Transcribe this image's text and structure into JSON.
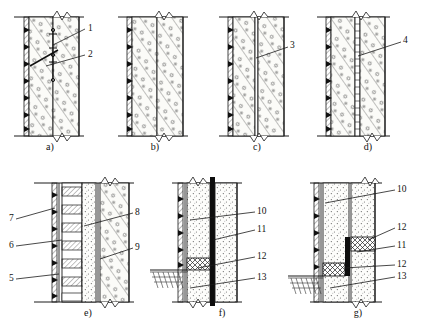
{
  "figure": {
    "type": "technical-section-diagram",
    "width": 429,
    "height": 332,
    "background_color": "#ffffff",
    "line_color": "#1a1a1a",
    "panel_count": 7
  },
  "panels": [
    {
      "id": "a",
      "letter": "a)",
      "callouts": [
        "1",
        "2"
      ],
      "layers": [
        "hatched-render",
        "masonry-circles-hatch",
        "masonry-circles-hatch"
      ],
      "has_break_symbol": true
    },
    {
      "id": "b",
      "letter": "b)",
      "callouts": [],
      "layers": [
        "hatched-render",
        "masonry-circles-hatch",
        "masonry-circles-hatch"
      ],
      "has_break_symbol": true
    },
    {
      "id": "c",
      "letter": "c)",
      "callouts": [
        "3"
      ],
      "layers": [
        "hatched-render",
        "masonry-circles-hatch",
        "cavity",
        "masonry-circles-hatch"
      ],
      "has_break_symbol": true
    },
    {
      "id": "d",
      "letter": "d)",
      "callouts": [
        "4"
      ],
      "layers": [
        "hatched-render",
        "masonry-circles-hatch",
        "ladder-tie-layer",
        "masonry-circles-hatch"
      ],
      "has_break_symbol": true
    },
    {
      "id": "e",
      "letter": "e)",
      "callouts": [
        "5",
        "6",
        "7",
        "8",
        "9"
      ],
      "layers": [
        "hatched-render",
        "block-course-stack",
        "stipple-insulation",
        "masonry-circles-hatch"
      ],
      "has_break_symbol": true
    },
    {
      "id": "f",
      "letter": "f)",
      "callouts": [
        "10",
        "11",
        "12",
        "13"
      ],
      "layers": [
        "hatched-render",
        "stipple-insulation",
        "black-membrane-bar",
        "stipple-insulation"
      ],
      "has_break_symbol": true,
      "has_floor_slab": true
    },
    {
      "id": "g",
      "letter": "g)",
      "callouts": [
        "10",
        "12",
        "11",
        "12",
        "13"
      ],
      "layers": [
        "hatched-render",
        "stipple-insulation",
        "crosshatch-blocks",
        "stipple-insulation"
      ],
      "has_break_symbol": true,
      "has_floor_slab": true
    }
  ],
  "callout_labels": {
    "a": [
      {
        "key": "1",
        "text": "1",
        "x": 88,
        "y": 31
      },
      {
        "key": "2",
        "text": "2",
        "x": 88,
        "y": 57
      }
    ],
    "c": [
      {
        "key": "3",
        "text": "3",
        "x": 290,
        "y": 48
      }
    ],
    "d": [
      {
        "key": "4",
        "text": "4",
        "x": 403,
        "y": 43
      }
    ],
    "e": [
      {
        "key": "7",
        "text": "7",
        "x": 9,
        "y": 221
      },
      {
        "key": "6",
        "text": "6",
        "x": 9,
        "y": 248
      },
      {
        "key": "5",
        "text": "5",
        "x": 9,
        "y": 281
      },
      {
        "key": "8",
        "text": "8",
        "x": 135,
        "y": 215
      },
      {
        "key": "9",
        "text": "9",
        "x": 135,
        "y": 250
      }
    ],
    "f": [
      {
        "key": "10",
        "text": "10",
        "x": 257,
        "y": 214
      },
      {
        "key": "11",
        "text": "11",
        "x": 257,
        "y": 232
      },
      {
        "key": "12",
        "text": "12",
        "x": 257,
        "y": 259
      },
      {
        "key": "13",
        "text": "13",
        "x": 257,
        "y": 280
      }
    ],
    "g": [
      {
        "key": "10",
        "text": "10",
        "x": 397,
        "y": 192
      },
      {
        "key": "12a",
        "text": "12",
        "x": 397,
        "y": 230
      },
      {
        "key": "11",
        "text": "11",
        "x": 397,
        "y": 248
      },
      {
        "key": "12b",
        "text": "12",
        "x": 397,
        "y": 267
      },
      {
        "key": "13",
        "text": "13",
        "x": 397,
        "y": 279
      }
    ]
  },
  "panel_letters": [
    {
      "id": "a",
      "text": "a)",
      "x": 50,
      "y": 150
    },
    {
      "id": "b",
      "text": "b)",
      "x": 155,
      "y": 150
    },
    {
      "id": "c",
      "text": "c)",
      "x": 257,
      "y": 150
    },
    {
      "id": "d",
      "text": "d)",
      "x": 368,
      "y": 150
    },
    {
      "id": "e",
      "text": "e)",
      "x": 88,
      "y": 316
    },
    {
      "id": "f",
      "text": "f)",
      "x": 222,
      "y": 316
    },
    {
      "id": "g",
      "text": "g)",
      "x": 358,
      "y": 316
    }
  ]
}
